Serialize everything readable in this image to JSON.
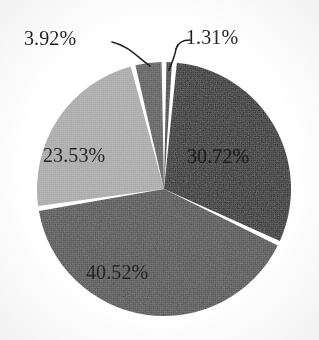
{
  "chart_data": {
    "type": "pie",
    "title": "",
    "subtitle": "",
    "xlabel": "",
    "ylabel": "",
    "legend": "none",
    "grid": false,
    "units": "percent",
    "start_angle_deg": 0,
    "direction": "clockwise",
    "center": {
      "x": 164,
      "y": 189
    },
    "radius": 127,
    "gap_deg": 2.2,
    "categories": [
      "1.31%",
      "30.72%",
      "40.52%",
      "23.53%",
      "3.92%"
    ],
    "values": [
      1.31,
      30.72,
      40.52,
      23.53,
      3.92
    ],
    "slices": [
      {
        "label": "1.31%",
        "value": 1.31,
        "color": "#3a3a3a",
        "label_position": "outside",
        "leader_line": true
      },
      {
        "label": "30.72%",
        "value": 30.72,
        "color": "#1a1a1a",
        "label_position": "inside",
        "leader_line": false
      },
      {
        "label": "40.52%",
        "value": 40.52,
        "color": "#4a4a4a",
        "label_position": "inside",
        "leader_line": false
      },
      {
        "label": "23.53%",
        "value": 23.53,
        "color": "#a8a8a8",
        "label_position": "inside",
        "leader_line": false
      },
      {
        "label": "3.92%",
        "value": 3.92,
        "color": "#555555",
        "label_position": "outside",
        "leader_line": true
      }
    ],
    "separator_color": "#ffffff",
    "background_color": "#ffffff"
  },
  "labels": {
    "slice_1_31": "1.31%",
    "slice_30_72": "30.72%",
    "slice_40_52": "40.52%",
    "slice_23_53": "23.53%",
    "slice_3_92": "3.92%"
  },
  "colors": {
    "darkest": "#1a1a1a",
    "dark": "#3a3a3a",
    "medium_dark": "#555555",
    "medium": "#4a4a4a",
    "light": "#a8a8a8",
    "background": "#ffffff",
    "separator": "#ffffff",
    "text": "#111111"
  }
}
